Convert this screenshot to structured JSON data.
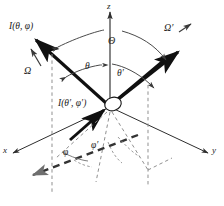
{
  "figure": {
    "colors": {
      "ink": "#1c1c1c",
      "thin_line": "#4a4a4a",
      "dashed": "#7d7d7d",
      "background": "#ffffff"
    },
    "axes": [
      {
        "name": "z",
        "label": "z"
      },
      {
        "name": "x",
        "label": "x"
      },
      {
        "name": "y",
        "label": "y"
      }
    ],
    "rays": [
      {
        "name": "scattered-radiance",
        "label": "I(θ, φ)"
      },
      {
        "name": "incident-radiance",
        "label": "I(θ′, φ′)"
      }
    ],
    "directions": [
      {
        "name": "omega",
        "label": "Ω"
      },
      {
        "name": "omega-prime",
        "label": "Ω′"
      }
    ],
    "angles": [
      {
        "name": "scattering-angle",
        "label": "Θ"
      },
      {
        "name": "polar-angle",
        "label": "θ"
      },
      {
        "name": "polar-angle-prime",
        "label": "θ′"
      },
      {
        "name": "azimuth-angle",
        "label": "φ"
      },
      {
        "name": "azimuth-angle-prime",
        "label": "φ′"
      }
    ]
  }
}
